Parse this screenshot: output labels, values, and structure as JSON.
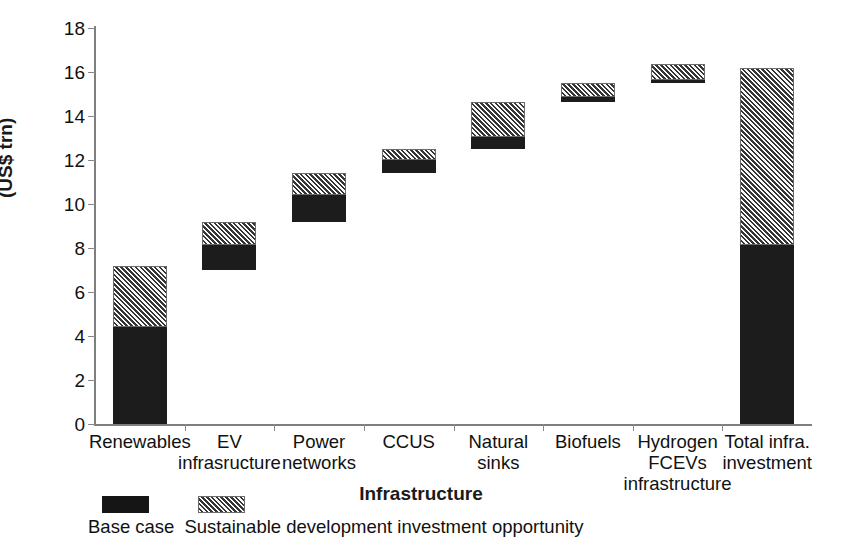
{
  "chart_data": {
    "type": "bar",
    "subtype": "waterfall-stacked",
    "title": "",
    "xlabel": "Infrastructure",
    "ylabel": "(US$ trn)",
    "ylim": [
      0,
      18
    ],
    "ytick_step": 2,
    "yticks": [
      "0",
      "2",
      "4",
      "6",
      "8",
      "10",
      "12",
      "14",
      "16",
      "18"
    ],
    "grid": false,
    "legend_position": "bottom-left",
    "categories": [
      "Renewables",
      "EV infrasructure",
      "Power networks",
      "CCUS",
      "Natural sinks",
      "Biofuels",
      "Hydrogen FCEVs infrastructure",
      "Total infra. investment"
    ],
    "category_label_lines": [
      [
        "Renewables"
      ],
      [
        "EV",
        "infrasructure"
      ],
      [
        "Power",
        "networks"
      ],
      [
        "CCUS"
      ],
      [
        "Natural",
        "sinks"
      ],
      [
        "Biofuels"
      ],
      [
        "Hydrogen",
        "FCEVs",
        "infrastructure"
      ],
      [
        "Total infra.",
        "investment"
      ]
    ],
    "series": [
      {
        "name": "Base case",
        "color": "#1c1c1c",
        "values": [
          4.4,
          1.15,
          1.0,
          0.6,
          0.55,
          0.2,
          0.15,
          8.15
        ]
      },
      {
        "name": "Sustainable development investment opportunity",
        "color": "#9a9a9a",
        "pattern": "diagonal-hatch",
        "values": [
          2.8,
          1.05,
          1.0,
          0.5,
          1.6,
          0.65,
          0.7,
          8.05
        ]
      }
    ],
    "waterfall_bars": [
      {
        "category": "Renewables",
        "start": 0.0,
        "base_top": 4.4,
        "total_top": 7.2
      },
      {
        "category": "EV infrasructure",
        "start": 7.0,
        "base_top": 8.15,
        "total_top": 9.2
      },
      {
        "category": "Power networks",
        "start": 9.2,
        "base_top": 10.4,
        "total_top": 11.4
      },
      {
        "category": "CCUS",
        "start": 11.4,
        "base_top": 12.0,
        "total_top": 12.5
      },
      {
        "category": "Natural sinks",
        "start": 12.5,
        "base_top": 13.05,
        "total_top": 14.65
      },
      {
        "category": "Biofuels",
        "start": 14.65,
        "base_top": 14.85,
        "total_top": 15.5
      },
      {
        "category": "Hydrogen FCEVs infrastructure",
        "start": 15.5,
        "base_top": 15.65,
        "total_top": 16.35
      },
      {
        "category": "Total infra. investment",
        "start": 0.0,
        "base_top": 8.15,
        "total_top": 16.2
      }
    ],
    "legend": [
      {
        "label": "Base case",
        "swatch": "solid-black"
      },
      {
        "label": "Sustainable development investment opportunity",
        "swatch": "hatched-grey"
      }
    ]
  }
}
